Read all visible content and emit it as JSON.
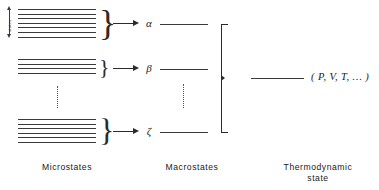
{
  "figure": {
    "background": "#ffffff",
    "ink": "#2b2b2b"
  },
  "side_label": {
    "text": "states",
    "arrow": "double-headed-vertical-arrow"
  },
  "microstate_groups": [
    {
      "id": "group-alpha",
      "line_count": 7,
      "brace": "}",
      "arrow": "right-arrow",
      "macrostate_label": "α",
      "macrostate_label_name": "alpha"
    },
    {
      "id": "group-beta",
      "line_count": 4,
      "brace": "}",
      "arrow": "right-arrow",
      "macrostate_label": "β",
      "macrostate_label_name": "beta"
    },
    {
      "id": "group-zeta",
      "line_count": 6,
      "brace": "}",
      "arrow": "right-arrow",
      "macrostate_label": "ζ",
      "macrostate_label_name": "zeta"
    }
  ],
  "ellipses": [
    {
      "id": "microstate-ellipsis",
      "glyph": "vertical-dots"
    },
    {
      "id": "macrostate-ellipsis",
      "glyph": "vertical-dots"
    }
  ],
  "aggregate_bracket": {
    "glyph": "right-facing-bracket",
    "spans": "all-macrostates"
  },
  "thermodynamic_state": {
    "connector": "horizontal-line",
    "formula": "( P, V, T, … )"
  },
  "captions": {
    "microstates": "Microstates",
    "macrostates": "Macrostates",
    "thermodynamic_state": "Thermodynamic\nstate"
  }
}
